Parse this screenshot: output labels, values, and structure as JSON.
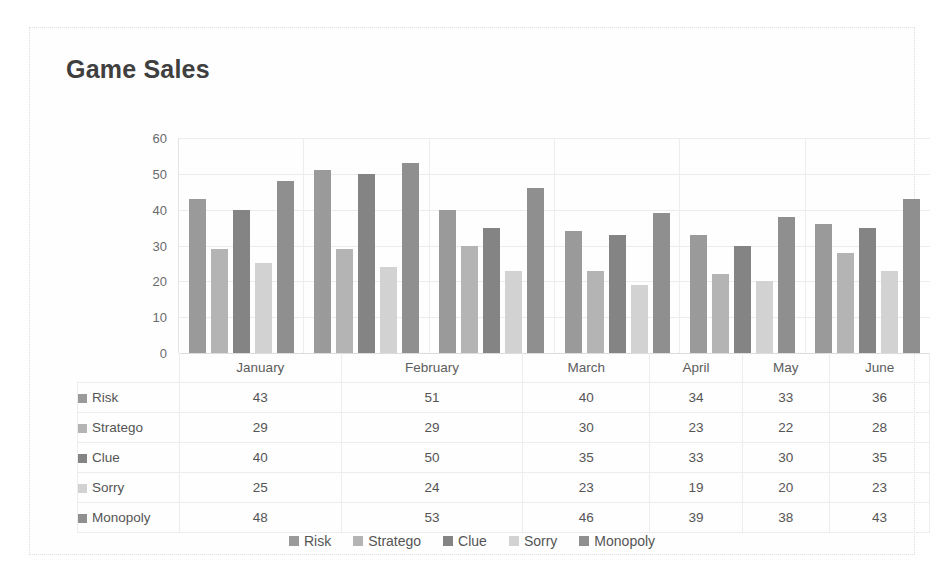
{
  "chart_data": {
    "type": "bar",
    "title": "Game Sales",
    "xlabel": "",
    "ylabel": "",
    "ylim": [
      0,
      60
    ],
    "yticks": [
      60,
      50,
      40,
      30,
      20,
      10,
      0
    ],
    "grid": true,
    "legend_position": "bottom",
    "data_table_visible": true,
    "categories": [
      "January",
      "February",
      "March",
      "April",
      "May",
      "June"
    ],
    "series": [
      {
        "name": "Risk",
        "values": [
          43,
          51,
          40,
          34,
          33,
          36
        ],
        "color": "#9a9a9a"
      },
      {
        "name": "Stratego",
        "values": [
          29,
          29,
          30,
          23,
          22,
          28
        ],
        "color": "#b4b4b4"
      },
      {
        "name": "Clue",
        "values": [
          40,
          50,
          35,
          33,
          30,
          35
        ],
        "color": "#848484"
      },
      {
        "name": "Sorry",
        "values": [
          25,
          24,
          23,
          19,
          20,
          23
        ],
        "color": "#d2d2d2"
      },
      {
        "name": "Monopoly",
        "values": [
          48,
          53,
          46,
          39,
          38,
          43
        ],
        "color": "#8f8f8f"
      }
    ]
  },
  "table": {
    "corner_label": "",
    "column_headers": [
      "January",
      "February",
      "March",
      "April",
      "May",
      "June"
    ],
    "rows": [
      {
        "label": "Risk",
        "values": [
          "43",
          "51",
          "40",
          "34",
          "33",
          "36"
        ]
      },
      {
        "label": "Stratego",
        "values": [
          "29",
          "29",
          "30",
          "23",
          "22",
          "28"
        ]
      },
      {
        "label": "Clue",
        "values": [
          "40",
          "50",
          "35",
          "33",
          "30",
          "35"
        ]
      },
      {
        "label": "Sorry",
        "values": [
          "25",
          "24",
          "23",
          "19",
          "20",
          "23"
        ]
      },
      {
        "label": "Monopoly",
        "values": [
          "48",
          "53",
          "46",
          "39",
          "38",
          "43"
        ]
      }
    ]
  },
  "legend": {
    "items": [
      "Risk",
      "Stratego",
      "Clue",
      "Sorry",
      "Monopoly"
    ]
  }
}
